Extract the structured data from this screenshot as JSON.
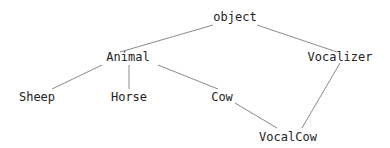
{
  "diagram": {
    "type": "class-hierarchy",
    "nodes": [
      {
        "id": "object",
        "label": "object",
        "x": 235,
        "y": 17
      },
      {
        "id": "animal",
        "label": "Animal",
        "x": 128,
        "y": 57
      },
      {
        "id": "vocalizer",
        "label": "Vocalizer",
        "x": 340,
        "y": 57
      },
      {
        "id": "sheep",
        "label": "Sheep",
        "x": 37,
        "y": 97
      },
      {
        "id": "horse",
        "label": "Horse",
        "x": 129,
        "y": 97
      },
      {
        "id": "cow",
        "label": "Cow",
        "x": 222,
        "y": 97
      },
      {
        "id": "vocalcow",
        "label": "VocalCow",
        "x": 288,
        "y": 137
      }
    ],
    "edges": [
      {
        "from": "object",
        "to": "Animal",
        "x1": 213,
        "y1": 25,
        "x2": 120,
        "y2": 52
      },
      {
        "from": "object",
        "to": "Vocalizer",
        "x1": 257,
        "y1": 25,
        "x2": 337,
        "y2": 52
      },
      {
        "from": "Animal",
        "to": "Sheep",
        "x1": 102,
        "y1": 65,
        "x2": 52,
        "y2": 89
      },
      {
        "from": "Animal",
        "to": "Horse",
        "x1": 129,
        "y1": 65,
        "x2": 129,
        "y2": 89
      },
      {
        "from": "Animal",
        "to": "Cow",
        "x1": 158,
        "y1": 65,
        "x2": 218,
        "y2": 89
      },
      {
        "from": "Cow",
        "to": "VocalCow",
        "x1": 235,
        "y1": 103,
        "x2": 277,
        "y2": 128
      },
      {
        "from": "Vocalizer",
        "to": "VocalCow",
        "x1": 340,
        "y1": 63,
        "x2": 302,
        "y2": 128
      }
    ],
    "colors": {
      "edge": "#8a8a8a",
      "text": "#222222",
      "background": "#ffffff"
    }
  }
}
